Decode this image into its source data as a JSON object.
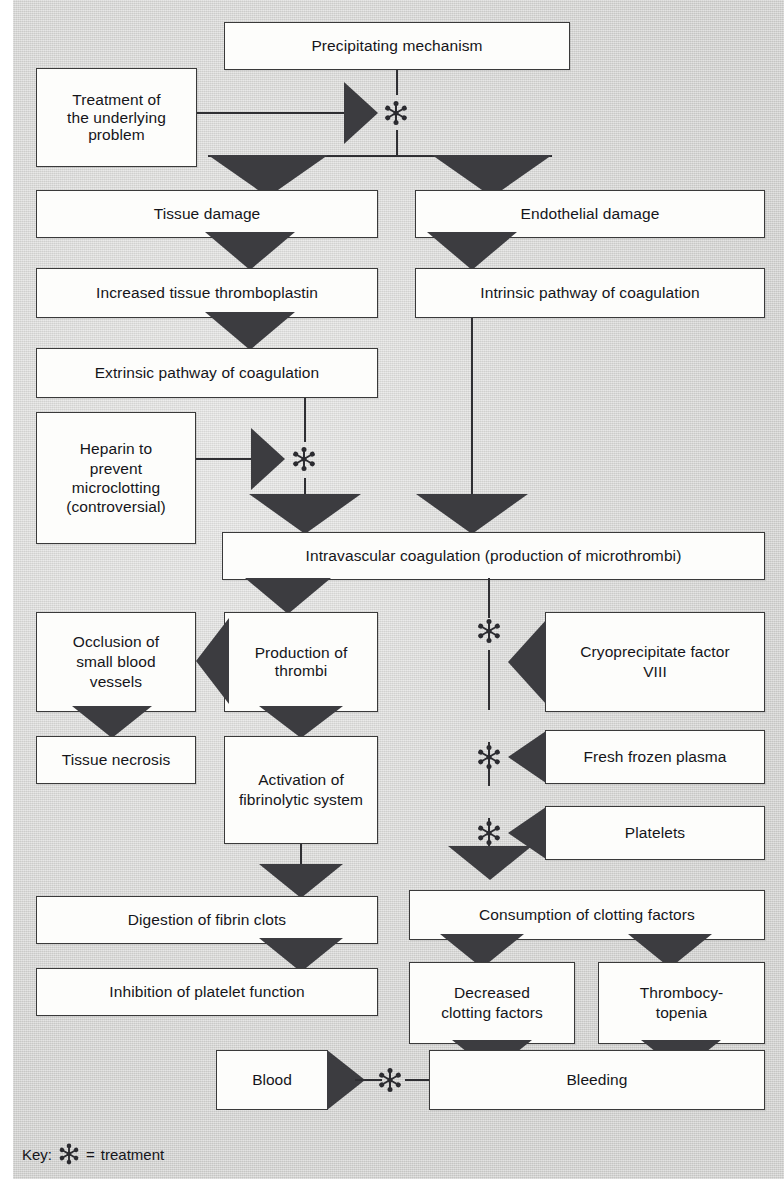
{
  "diagram": {
    "key": {
      "label": "Key:",
      "icon": "treatment-asterisk-icon",
      "equals": "=",
      "meaning": "treatment"
    },
    "colors": {
      "background": "#d9d9d7",
      "box_fill": "#fdfdfb",
      "box_border": "#3a3a3a",
      "arrow_fill": "#3c3c40",
      "text": "#15151a"
    },
    "nodes": {
      "precipitating_mechanism": "Precipitating mechanism",
      "treatment_underlying": "Treatment of\nthe underlying\nproblem",
      "tissue_damage": "Tissue damage",
      "endothelial_damage": "Endothelial damage",
      "increased_thromboplastin": "Increased tissue thromboplastin",
      "intrinsic_pathway": "Intrinsic pathway of coagulation",
      "extrinsic_pathway": "Extrinsic pathway of coagulation",
      "heparin": "Heparin to\nprevent\nmicroclotting\n(controversial)",
      "intravascular_coagulation": "Intravascular coagulation (production of microthrombi)",
      "occlusion": "Occlusion of\nsmall blood\nvessels",
      "production_thrombi": "Production of thrombi",
      "cryoprecipitate": "Cryoprecipitate factor\nVIII",
      "tissue_necrosis": "Tissue necrosis",
      "activation_fibrinolytic": "Activation of\nfibrinolytic system",
      "fresh_frozen_plasma": "Fresh frozen plasma",
      "platelets": "Platelets",
      "digestion_fibrin": "Digestion of fibrin clots",
      "consumption_clotting": "Consumption of clotting factors",
      "inhibition_platelet": "Inhibition of platelet function",
      "decreased_clotting": "Decreased\nclotting factors",
      "thrombocytopenia": "Thrombocy-\ntopenia",
      "blood": "Blood",
      "bleeding": "Bleeding"
    }
  }
}
